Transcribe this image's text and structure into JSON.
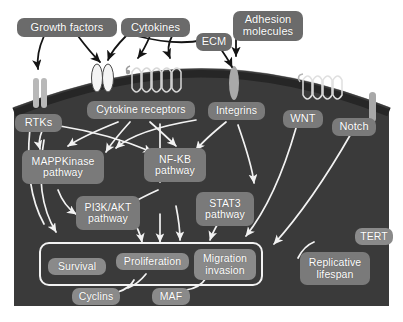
{
  "figure": {
    "kind": "cell-signalling-pathway-diagram",
    "background": "#ffffff",
    "panel_color": "#3a3a3a",
    "membrane_color": "#2b2b2b",
    "pill_color": "#6e6e6e",
    "arrow_outside_color": "#1a1a1a",
    "arrow_inside_color": "#ffffff"
  },
  "extracellular": {
    "ligands": [
      {
        "id": "growth-factors",
        "label": "Growth factors"
      },
      {
        "id": "cytokines",
        "label": "Cytokines"
      },
      {
        "id": "ecm",
        "label": "ECM"
      },
      {
        "id": "adhesion-molecules",
        "label": "Adhesion\nmolecules",
        "line1": "Adhesion",
        "line2": "molecules"
      }
    ]
  },
  "membrane": {
    "receptors": [
      {
        "id": "rtks",
        "label": "RTKs"
      },
      {
        "id": "cytokine-receptors",
        "label": "Cytokine receptors"
      },
      {
        "id": "integrins",
        "label": "Integrins"
      },
      {
        "id": "wnt",
        "label": "WNT"
      },
      {
        "id": "notch",
        "label": "Notch"
      }
    ]
  },
  "intracellular": {
    "pathways": [
      {
        "id": "mappkinase",
        "line1": "MAPPKinase",
        "line2": "pathway"
      },
      {
        "id": "nfkb",
        "line1": "NF-KB",
        "line2": "pathway"
      },
      {
        "id": "pi3k-akt",
        "line1": "PI3K/AKT",
        "line2": "pathway"
      },
      {
        "id": "stat3",
        "line1": "STAT3",
        "line2": "pathway"
      }
    ],
    "outcomes": [
      {
        "id": "survival",
        "line1": "Survival",
        "line2": ""
      },
      {
        "id": "proliferation",
        "line1": "Proliferation",
        "line2": ""
      },
      {
        "id": "migration-invasion",
        "line1": "Migration",
        "line2": "invasion"
      }
    ],
    "effectors": [
      {
        "id": "cyclins",
        "label": "Cyclins"
      },
      {
        "id": "maf",
        "label": "MAF"
      },
      {
        "id": "tert",
        "label": "TERT"
      }
    ],
    "other": [
      {
        "id": "replicative-lifespan",
        "line1": "Replicative",
        "line2": "lifespan"
      }
    ]
  }
}
